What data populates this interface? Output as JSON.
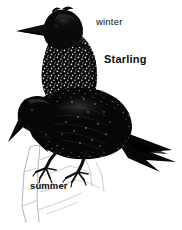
{
  "illustration": {
    "subject": "Starling",
    "background_color": "#ffffff",
    "ink_color": "#0d0d0d",
    "perch_color": "#b9b9b9",
    "labels": {
      "title": "Starling",
      "winter": "winter",
      "summer": "summer"
    },
    "figures": [
      {
        "name": "winter-plumage-starling",
        "label": "winter",
        "description": "Upper bird, heavily white-speckled black plumage, head facing left"
      },
      {
        "name": "summer-plumage-starling",
        "label": "summer",
        "description": "Lower bird, glossy black plumage with sparse speckles, head bowed, perched on branch"
      }
    ],
    "elements": {
      "perch": "sketched branch perch",
      "feet": "clawed feet gripping perch"
    }
  }
}
